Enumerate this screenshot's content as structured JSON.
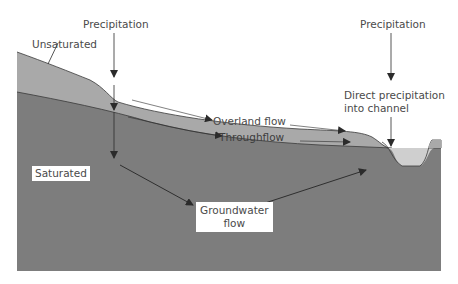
{
  "diagram": {
    "type": "hydrological cross-section",
    "labels": {
      "precipitation_left": "Precipitation",
      "precipitation_right": "Precipitation",
      "unsaturated": "Unsaturated",
      "saturated": "Saturated",
      "overland_flow": "Overland flow",
      "throughflow": "Throughflow",
      "direct_precipitation_line1": "Direct precipitation",
      "direct_precipitation_line2": "into channel",
      "groundwater_line1": "Groundwater",
      "groundwater_line2": "flow"
    },
    "colors": {
      "saturated_zone": "#7d7d7d",
      "unsaturated_zone": "#a9a9a9",
      "channel_water": "#cfcfcf",
      "arrow": "#2b2b2b",
      "text": "#4a4a4a",
      "background": "#ffffff"
    }
  }
}
